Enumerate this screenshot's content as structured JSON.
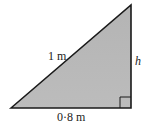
{
  "diagram": {
    "type": "right-triangle",
    "vertices": {
      "bottom_left": [
        11,
        108
      ],
      "top_right": [
        131,
        5
      ],
      "right_angle": [
        131,
        108
      ]
    },
    "labels": {
      "hypotenuse": "1 m",
      "height": "h",
      "base": "0·8 m"
    },
    "colors": {
      "fill": "#b8b8b8",
      "stroke": "#1a1a1a",
      "background": "#ffffff"
    },
    "right_angle_marker_size": 11
  }
}
